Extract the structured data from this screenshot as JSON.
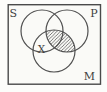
{
  "figure": {
    "type": "venn-diagram",
    "labels": {
      "s": "S",
      "p": "P",
      "m": "M",
      "x": "X"
    },
    "hatched_region": "P ∩ M",
    "x_marker_region": "S ∩ M (outside P)",
    "colors": {
      "background": "#fcfcfa",
      "paper": "#fafaf7",
      "line": "#4a4a4a",
      "hatch_line": "#4a4a4a"
    }
  }
}
